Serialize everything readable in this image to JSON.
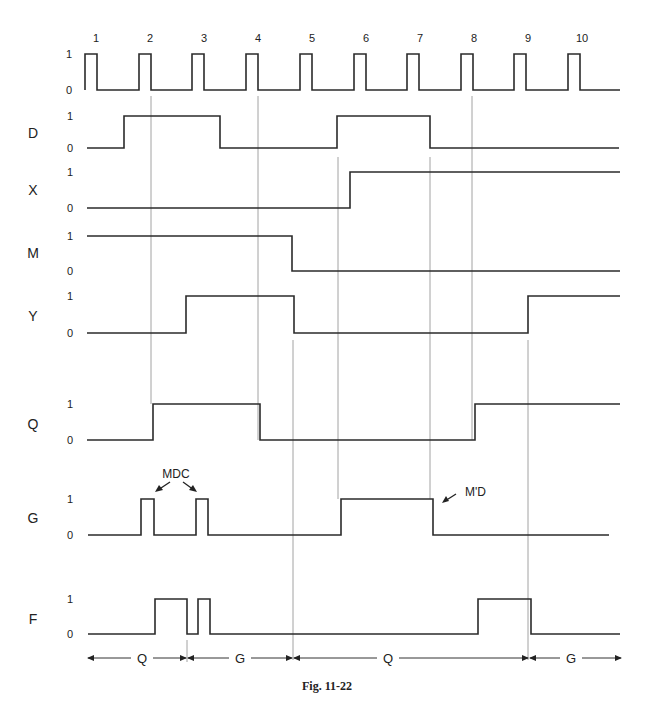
{
  "caption": "Fig. 11-22",
  "clock": {
    "labels": [
      "1",
      "2",
      "3",
      "4",
      "5",
      "6",
      "7",
      "8",
      "9",
      "10"
    ],
    "label_x": [
      96,
      150,
      204,
      258,
      312,
      366,
      420,
      474,
      528,
      582
    ],
    "level_high": "1",
    "level_low": "0",
    "pulse_rises": [
      85,
      139,
      192,
      246,
      300,
      354,
      407,
      461,
      514,
      568
    ],
    "pulse_width": 12,
    "high_y": 54,
    "low_y": 90,
    "start_x": 85,
    "end_x": 620
  },
  "signals": [
    {
      "name": "D",
      "label_y": 133,
      "high_y": 116,
      "low_y": 148,
      "start_x": 87,
      "end_x": 619,
      "start_level": 0,
      "transitions": [
        124,
        220,
        337,
        430
      ]
    },
    {
      "name": "X",
      "label_y": 190,
      "high_y": 172,
      "low_y": 208,
      "start_x": 87,
      "end_x": 620,
      "start_level": 0,
      "transitions": [
        350
      ]
    },
    {
      "name": "M",
      "label_y": 253,
      "high_y": 236,
      "low_y": 271,
      "start_x": 87,
      "end_x": 620,
      "start_level": 1,
      "transitions": [
        292
      ]
    },
    {
      "name": "Y",
      "label_y": 316,
      "high_y": 296,
      "low_y": 333,
      "start_x": 87,
      "end_x": 620,
      "start_level": 0,
      "transitions": [
        186,
        294,
        528
      ]
    },
    {
      "name": "Q",
      "label_y": 424,
      "high_y": 404,
      "low_y": 440,
      "start_x": 87,
      "end_x": 620,
      "start_level": 0,
      "transitions": [
        153,
        260,
        475
      ]
    },
    {
      "name": "G",
      "label_y": 518,
      "high_y": 499,
      "low_y": 535,
      "start_x": 88,
      "end_x": 609,
      "start_level": 0,
      "transitions": [
        141,
        154,
        196,
        208,
        341,
        433
      ]
    },
    {
      "name": "F",
      "label_y": 619,
      "high_y": 599,
      "low_y": 634,
      "start_x": 88,
      "end_x": 620,
      "start_level": 0,
      "transitions": [
        155,
        187,
        198,
        210,
        478,
        531
      ]
    }
  ],
  "level_labels": {
    "high": "1",
    "low": "0"
  },
  "guides": [
    {
      "x": 151,
      "y1": 96,
      "y2": 404
    },
    {
      "x": 258,
      "y1": 96,
      "y2": 440
    },
    {
      "x": 472,
      "y1": 96,
      "y2": 440
    },
    {
      "x": 338,
      "y1": 157,
      "y2": 499
    },
    {
      "x": 430,
      "y1": 157,
      "y2": 499
    },
    {
      "x": 293,
      "y1": 340,
      "y2": 660
    },
    {
      "x": 528,
      "y1": 340,
      "y2": 660
    },
    {
      "x": 187,
      "y1": 640,
      "y2": 662
    }
  ],
  "annotations": {
    "mdc": {
      "text": "MDC",
      "x": 176,
      "y": 478
    },
    "mpd": {
      "text": "M'D",
      "x": 465,
      "y": 496
    }
  },
  "segments": [
    {
      "label": "Q",
      "x1": 87,
      "x2": 187,
      "label_x": 142
    },
    {
      "label": "G",
      "x1": 187,
      "x2": 293,
      "label_x": 240
    },
    {
      "label": "Q",
      "x1": 293,
      "x2": 529,
      "label_x": 388
    },
    {
      "label": "G",
      "x1": 529,
      "x2": 622,
      "label_x": 571
    }
  ],
  "segments_y": 658
}
